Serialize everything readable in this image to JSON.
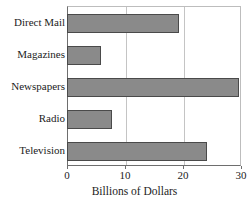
{
  "chart_data": {
    "type": "bar",
    "orientation": "horizontal",
    "title": "",
    "xlabel": "Billions of Dollars",
    "ylabel": "",
    "categories": [
      "Direct Mail",
      "Magazines",
      "Newspapers",
      "Radio",
      "Television"
    ],
    "values": [
      19.1,
      5.7,
      29.4,
      7.6,
      24.0
    ],
    "xlim": [
      0,
      30
    ],
    "xticks": [
      0,
      10,
      20,
      30
    ],
    "xtick_labels": [
      "0",
      "10",
      "20",
      "30"
    ],
    "grid": true,
    "grid_axis": "x",
    "legend": false,
    "bar_color": "#8a8a8a",
    "bar_border_color": "#4a4a4a",
    "background_color": "#ffffff",
    "axis_color": "#6e6e6e",
    "gridline_color": "#c4c4c4"
  },
  "axis_title": "Billions of Dollars",
  "clipped_title": ""
}
